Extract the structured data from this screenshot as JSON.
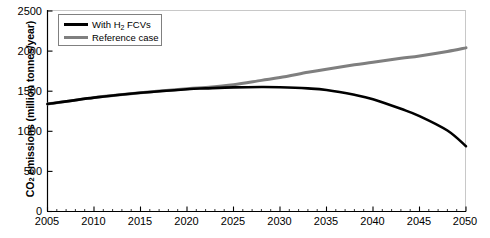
{
  "chart_data": {
    "type": "line",
    "title": "",
    "xlabel": "",
    "ylabel": "CO2 emissions (million tonnes/year)",
    "ylabel_prefix": "CO",
    "ylabel_sub": "2",
    "ylabel_suffix": " emissions (million tonnes/year)",
    "xlim": [
      2005,
      2050
    ],
    "ylim": [
      0,
      2500
    ],
    "grid": false,
    "legend_position": "top-left",
    "x_ticks": [
      2005,
      2010,
      2015,
      2020,
      2025,
      2030,
      2035,
      2040,
      2045,
      2050
    ],
    "x_minor_tick_interval": 1,
    "y_ticks": [
      0,
      500,
      1000,
      1500,
      2000,
      2500
    ],
    "x": [
      2005,
      2010,
      2015,
      2020,
      2022,
      2025,
      2028,
      2030,
      2033,
      2035,
      2038,
      2040,
      2043,
      2045,
      2048,
      2050
    ],
    "series": [
      {
        "name": "With H2 FCVs",
        "label_prefix": "With H",
        "label_sub": "2",
        "label_suffix": " FCVs",
        "color": "#000000",
        "width": 2.6,
        "values": [
          1340,
          1420,
          1480,
          1525,
          1535,
          1548,
          1553,
          1550,
          1535,
          1515,
          1455,
          1400,
          1280,
          1190,
          1010,
          815
        ]
      },
      {
        "name": "Reference case",
        "label": "Reference case",
        "color": "#7f7f7f",
        "width": 3.0,
        "values": [
          1340,
          1420,
          1480,
          1530,
          1545,
          1580,
          1635,
          1670,
          1735,
          1775,
          1830,
          1860,
          1910,
          1940,
          1995,
          2040
        ]
      }
    ]
  },
  "axes": {
    "y_tick_labels": [
      "2500",
      "2000",
      "1500",
      "1000",
      "500",
      "0"
    ],
    "x_tick_labels": [
      "2005",
      "2010",
      "2015",
      "2020",
      "2025",
      "2030",
      "2035",
      "2040",
      "2045",
      "2050"
    ]
  },
  "legend": {
    "items": [
      {
        "label_prefix": "With H",
        "label_sub": "2",
        "label_suffix": " FCVs",
        "color": "#000000"
      },
      {
        "label_prefix": "Reference case",
        "label_sub": "",
        "label_suffix": "",
        "color": "#7f7f7f"
      }
    ]
  },
  "colors": {
    "axis": "#000000",
    "plot_border": "#c8c8c8",
    "series_primary": "#000000",
    "series_reference": "#7f7f7f",
    "background": "#ffffff"
  }
}
